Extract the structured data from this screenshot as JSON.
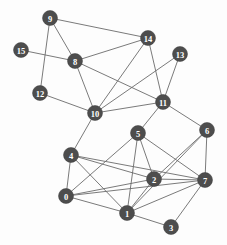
{
  "diagram": {
    "type": "node-link-graph",
    "width": 227,
    "height": 245,
    "background_color": "#fdfdfd",
    "node_fill_color": "#4d4d4d",
    "node_label_color": "#ffffff",
    "edge_color": "#6b6b6b",
    "node_radius": 7.5,
    "node_count": 16,
    "edge_count": 40
  },
  "chart_data": {
    "type": "graph",
    "directed": false,
    "nodes": [
      {
        "id": "0",
        "label": "0",
        "x": 66,
        "y": 196
      },
      {
        "id": "1",
        "label": "1",
        "x": 127,
        "y": 213
      },
      {
        "id": "2",
        "label": "2",
        "x": 154,
        "y": 179
      },
      {
        "id": "3",
        "label": "3",
        "x": 171,
        "y": 227
      },
      {
        "id": "4",
        "label": "4",
        "x": 71,
        "y": 155
      },
      {
        "id": "5",
        "label": "5",
        "x": 138,
        "y": 133
      },
      {
        "id": "6",
        "label": "6",
        "x": 207,
        "y": 130
      },
      {
        "id": "7",
        "label": "7",
        "x": 205,
        "y": 180
      },
      {
        "id": "8",
        "label": "8",
        "x": 75,
        "y": 61
      },
      {
        "id": "9",
        "label": "9",
        "x": 50,
        "y": 18
      },
      {
        "id": "10",
        "label": "10",
        "x": 95,
        "y": 113
      },
      {
        "id": "11",
        "label": "11",
        "x": 163,
        "y": 102
      },
      {
        "id": "12",
        "label": "12",
        "x": 40,
        "y": 93
      },
      {
        "id": "13",
        "label": "13",
        "x": 180,
        "y": 54
      },
      {
        "id": "14",
        "label": "14",
        "x": 148,
        "y": 38
      },
      {
        "id": "15",
        "label": "15",
        "x": 21,
        "y": 50
      }
    ],
    "edges": [
      {
        "source": "9",
        "target": "14"
      },
      {
        "source": "9",
        "target": "8"
      },
      {
        "source": "9",
        "target": "12"
      },
      {
        "source": "15",
        "target": "8"
      },
      {
        "source": "8",
        "target": "14"
      },
      {
        "source": "8",
        "target": "10"
      },
      {
        "source": "8",
        "target": "11"
      },
      {
        "source": "12",
        "target": "10"
      },
      {
        "source": "14",
        "target": "10"
      },
      {
        "source": "14",
        "target": "11"
      },
      {
        "source": "13",
        "target": "10"
      },
      {
        "source": "13",
        "target": "11"
      },
      {
        "source": "10",
        "target": "11"
      },
      {
        "source": "10",
        "target": "4"
      },
      {
        "source": "11",
        "target": "5"
      },
      {
        "source": "11",
        "target": "6"
      },
      {
        "source": "5",
        "target": "2"
      },
      {
        "source": "5",
        "target": "1"
      },
      {
        "source": "5",
        "target": "7"
      },
      {
        "source": "5",
        "target": "0"
      },
      {
        "source": "6",
        "target": "2"
      },
      {
        "source": "6",
        "target": "7"
      },
      {
        "source": "6",
        "target": "1"
      },
      {
        "source": "7",
        "target": "2"
      },
      {
        "source": "7",
        "target": "1"
      },
      {
        "source": "7",
        "target": "3"
      },
      {
        "source": "7",
        "target": "0"
      },
      {
        "source": "7",
        "target": "4"
      },
      {
        "source": "2",
        "target": "1"
      },
      {
        "source": "2",
        "target": "0"
      },
      {
        "source": "2",
        "target": "4"
      },
      {
        "source": "1",
        "target": "0"
      },
      {
        "source": "1",
        "target": "3"
      },
      {
        "source": "1",
        "target": "4"
      },
      {
        "source": "0",
        "target": "4"
      }
    ]
  }
}
